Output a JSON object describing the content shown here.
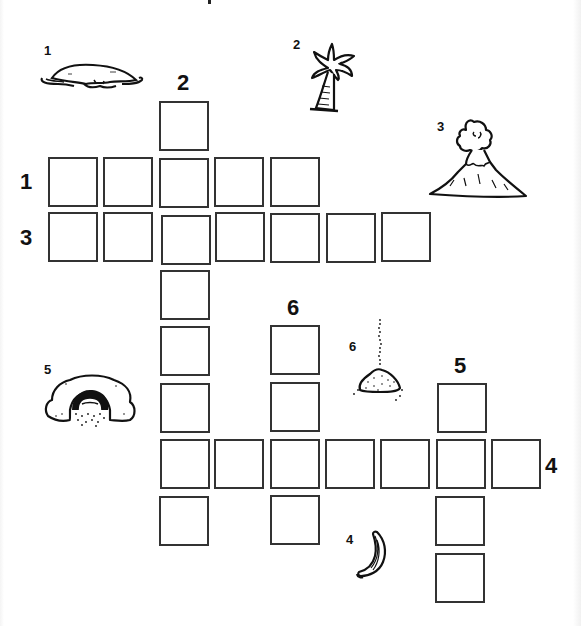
{
  "puzzle": {
    "type": "picture-crossword",
    "cell_size_px": 50,
    "clue_pictures": [
      {
        "number": "1",
        "icon": "island-icon",
        "depicts": "island"
      },
      {
        "number": "2",
        "icon": "palm-tree-icon",
        "depicts": "palm tree"
      },
      {
        "number": "3",
        "icon": "volcano-icon",
        "depicts": "volcano"
      },
      {
        "number": "4",
        "icon": "banana-icon",
        "depicts": "banana"
      },
      {
        "number": "5",
        "icon": "cave-icon",
        "depicts": "cave"
      },
      {
        "number": "6",
        "icon": "sand-icon",
        "depicts": "sand pile"
      }
    ],
    "words": [
      {
        "number": "1",
        "direction": "across",
        "length": 5
      },
      {
        "number": "2",
        "direction": "down",
        "length": 8
      },
      {
        "number": "3",
        "direction": "across",
        "length": 7
      },
      {
        "number": "4",
        "direction": "across",
        "length": 7
      },
      {
        "number": "5",
        "direction": "down",
        "length": 4
      },
      {
        "number": "6",
        "direction": "down",
        "length": 4
      }
    ],
    "grid_labels": {
      "one": "1",
      "two": "2",
      "three": "3",
      "four": "4",
      "five": "5",
      "six": "6"
    },
    "picture_labels": {
      "island": "1",
      "palm": "2",
      "volcano": "3",
      "banana": "4",
      "cave": "5",
      "sand": "6"
    },
    "cell_values": {
      "c1": "",
      "c2": "",
      "c3": "",
      "c4": "",
      "c5": "",
      "c6": "",
      "c7": "",
      "c8": "",
      "c9": "",
      "c10": "",
      "c11": "",
      "c12": "",
      "c13": "",
      "c14": "",
      "c15": "",
      "c16": "",
      "c17": "",
      "c18": "",
      "c19": "",
      "c20": "",
      "c21": "",
      "c22": "",
      "c23": "",
      "c24": "",
      "c25": "",
      "c26": "",
      "c27": ""
    }
  }
}
